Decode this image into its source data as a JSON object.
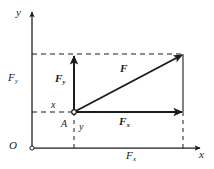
{
  "figure": {
    "background_color": "#ffffff",
    "line_color": "#1b1b1b",
    "width": 214,
    "height": 169
  },
  "axes": {
    "y_axis_label": "y",
    "x_axis_label": "x",
    "origin_label": "O"
  },
  "tick_labels": {
    "y_component_axis": "F",
    "y_component_axis_sub": "y",
    "x_component_axis": "F",
    "x_component_axis_sub": "x"
  },
  "point": {
    "label": "A",
    "x_offset_label": "x",
    "y_offset_label": "y"
  },
  "vectors": [
    {
      "name": "resultant-force",
      "label": "F",
      "subscript": "",
      "direction": "diagonal",
      "from": "A",
      "to": "tip"
    },
    {
      "name": "force-y-component",
      "label": "F",
      "subscript": "y",
      "direction": "vertical",
      "from": "A",
      "to": "top"
    },
    {
      "name": "force-x-component",
      "label": "F",
      "subscript": "x",
      "direction": "horizontal",
      "from": "A",
      "to": "right"
    }
  ]
}
